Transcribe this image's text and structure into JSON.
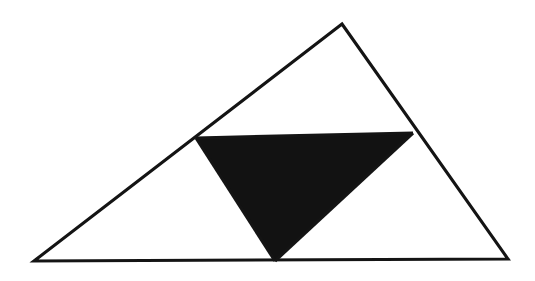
{
  "figure": {
    "canvas": {
      "width": 535,
      "height": 281,
      "background_color": "#ffffff"
    },
    "style": {
      "stroke_color": "#141414",
      "stroke_width": 3.1,
      "fill_color": "#121212"
    },
    "shapes": {
      "outer_triangle": {
        "name": "outer-triangle",
        "vertices": [
          [
            342,
            24
          ],
          [
            508,
            259
          ],
          [
            34,
            261
          ]
        ],
        "points_attr": "342,24 508,259 34,261",
        "filled": false
      },
      "medial_triangle": {
        "name": "shaded-medial-triangle",
        "vertices": [
          [
            196,
            138
          ],
          [
            413,
            133
          ],
          [
            275,
            261
          ]
        ],
        "points_attr": "196,138 413,133 275,261",
        "filled": true
      },
      "midsegment_left": {
        "name": "left-midsegment",
        "from": [
          196,
          138
        ],
        "to": [
          275,
          261
        ],
        "path_attr": "M 196,138 L 275,261"
      },
      "midsegment_right": {
        "name": "right-midsegment",
        "from": [
          413,
          133
        ],
        "to": [
          275,
          261
        ],
        "path_attr": "M 413,133 L 275,261"
      },
      "midsegment_top": {
        "name": "top-midsegment",
        "from": [
          196,
          138
        ],
        "to": [
          413,
          133
        ],
        "path_attr": "M 196,138 L 413,133"
      }
    },
    "labels": {
      "caption": ""
    }
  }
}
